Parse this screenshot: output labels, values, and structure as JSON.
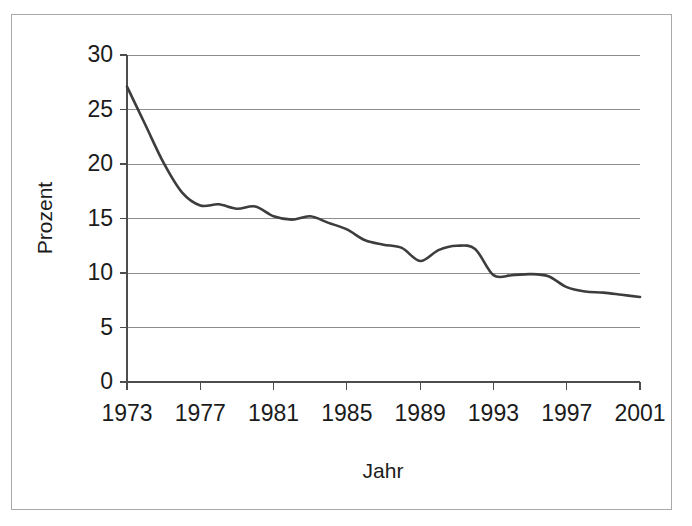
{
  "figure": {
    "background_color": "#ffffff",
    "frame_color": "#a9a9a9",
    "line_color": "#3d3d3d",
    "grid_color": "#8c8c8c",
    "axis_color": "#4d4d4d",
    "text_color": "#1b1b1b"
  },
  "axis_titles": {
    "x": "Jahr",
    "y": "Prozent"
  },
  "y_ticks": [
    "0",
    "5",
    "10",
    "15",
    "20",
    "25",
    "30"
  ],
  "x_ticks": [
    "1973",
    "1977",
    "1981",
    "1985",
    "1989",
    "1993",
    "1997",
    "2001"
  ],
  "chart_data": {
    "type": "line",
    "title": "",
    "subtitle": "",
    "xlabel": "Jahr",
    "ylabel": "Prozent",
    "xlim": [
      1973,
      2001
    ],
    "ylim": [
      0,
      30
    ],
    "xtick_values": [
      1973,
      1977,
      1981,
      1985,
      1989,
      1993,
      1997,
      2001
    ],
    "ytick_values": [
      0,
      5,
      10,
      15,
      20,
      25,
      30
    ],
    "grid": "horizontal",
    "legend": "none",
    "annotations": [],
    "series": [
      {
        "name": "Prozent",
        "color": "#3d3d3d",
        "x": [
          1973,
          1974,
          1975,
          1976,
          1977,
          1978,
          1979,
          1980,
          1981,
          1982,
          1983,
          1984,
          1985,
          1986,
          1987,
          1988,
          1989,
          1990,
          1991,
          1992,
          1993,
          1994,
          1995,
          1996,
          1997,
          1998,
          1999,
          2000,
          2001
        ],
        "values": [
          27.1,
          23.6,
          20.1,
          17.4,
          16.2,
          16.3,
          15.9,
          16.1,
          15.2,
          14.9,
          15.2,
          14.6,
          14.0,
          13.0,
          12.6,
          12.3,
          11.1,
          12.1,
          12.5,
          12.2,
          9.8,
          9.8,
          9.9,
          9.7,
          8.7,
          8.3,
          8.2,
          8.0,
          7.8
        ]
      }
    ]
  }
}
